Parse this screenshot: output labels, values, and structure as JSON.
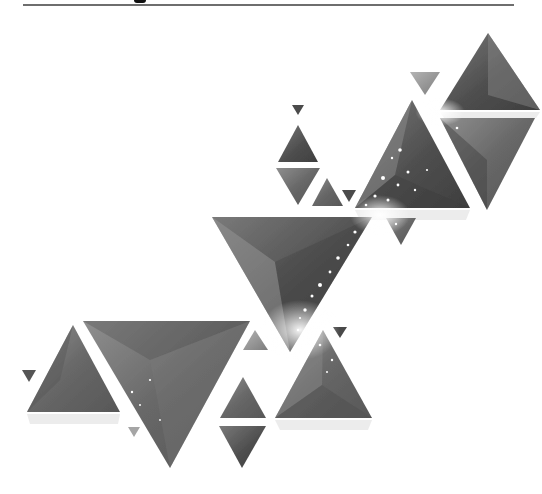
{
  "image": {
    "description": "Abstract geometric illustration of grayscale faceted triangles arranged diagonally from lower-left to upper-right, with white sparkle speckles",
    "header_rule": {
      "color": "#6e6e6e"
    },
    "palette": {
      "background": "#ffffff",
      "dark": "#4a4a4a",
      "mid": "#6b6b6b",
      "light": "#9a9a9a",
      "highlight": "#d9d9d9",
      "sparkle": "#ffffff"
    },
    "triangles": [
      {
        "id": "top-right-up",
        "points": "488,33 440,110 540,110",
        "fill": "dark"
      },
      {
        "id": "top-right-down",
        "points": "440,118 535,118 487,210",
        "fill": "mid"
      },
      {
        "id": "small-top-down",
        "points": "410,72 440,72 425,95",
        "fill": "light"
      },
      {
        "id": "center-right-up",
        "points": "412,100 355,208 470,208",
        "fill": "dark"
      },
      {
        "id": "tiny-top-down",
        "points": "292,105 304,105 298,115",
        "fill": "dark"
      },
      {
        "id": "stack-up",
        "points": "298,125 278,162 318,162",
        "fill": "dark"
      },
      {
        "id": "stack-down",
        "points": "276,168 320,168 298,205",
        "fill": "mid"
      },
      {
        "id": "small-up-mid",
        "points": "327,178 312,206 343,206",
        "fill": "mid"
      },
      {
        "id": "tiny-down-mid",
        "points": "342,190 356,190 349,202",
        "fill": "dark"
      },
      {
        "id": "small-down-right",
        "points": "386,218 416,218 401,245",
        "fill": "mid"
      },
      {
        "id": "big-center-down",
        "points": "212,217 372,217 290,352",
        "fill": "dark"
      },
      {
        "id": "left-up",
        "points": "73,325 27,412 120,412",
        "fill": "mid"
      },
      {
        "id": "tiny-left-down",
        "points": "22,370 36,370 29,382",
        "fill": "dark"
      },
      {
        "id": "big-left-down",
        "points": "83,321 250,321 170,468",
        "fill": "mid"
      },
      {
        "id": "small-mid-down",
        "points": "128,427 140,427 134,437",
        "fill": "light"
      },
      {
        "id": "small-mid-up",
        "points": "255,330 243,350 268,350",
        "fill": "light"
      },
      {
        "id": "mid-up-lower",
        "points": "243,377 220,418 266,418",
        "fill": "mid"
      },
      {
        "id": "mid-down-lower",
        "points": "219,426 266,426 242,468",
        "fill": "dark"
      },
      {
        "id": "right-up-lower",
        "points": "323,330 275,418 372,418",
        "fill": "mid"
      },
      {
        "id": "tiny-right-down",
        "points": "333,327 347,327 340,338",
        "fill": "dark"
      }
    ]
  }
}
